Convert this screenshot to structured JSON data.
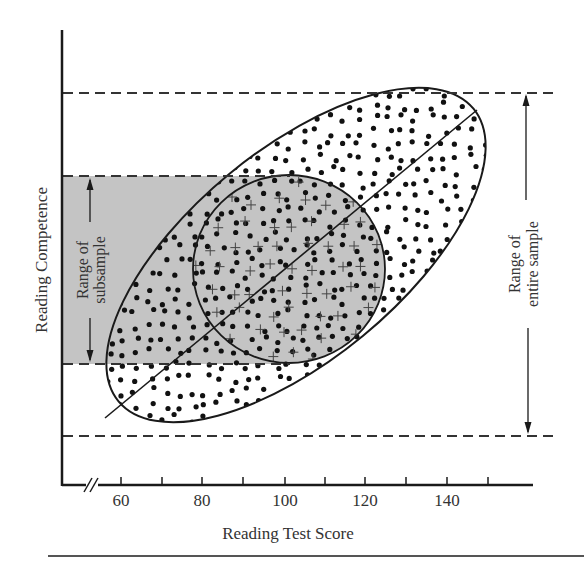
{
  "chart_data": {
    "type": "scatter",
    "title": "",
    "xlabel": "Reading Test Score",
    "ylabel": "Reading Competence",
    "x_ticks": [
      60,
      70,
      80,
      90,
      100,
      110,
      120,
      130,
      140,
      150
    ],
    "x_tick_labels": [
      "60",
      "80",
      "100",
      "120",
      "140"
    ],
    "x_axis_break": true,
    "xlim": [
      50,
      162
    ],
    "y_ticks": [],
    "grid": false,
    "legend": null,
    "annotations": [
      {
        "text": "Range of subsample",
        "type": "vertical-double-arrow",
        "position": "left, inside gray band"
      },
      {
        "text": "Range of entire sample",
        "type": "vertical-double-arrow",
        "position": "right, between dashed lines"
      }
    ],
    "series": [
      {
        "name": "entire sample",
        "marker": "dot",
        "shape": "elongated ellipse along regression line, x range ~57 to ~152"
      },
      {
        "name": "subsample",
        "marker": "plus",
        "shape": "circle centered near x=100, x range ~82 to ~120"
      }
    ],
    "regression_line": {
      "x_start": 57,
      "x_end": 147,
      "direction": "positive"
    },
    "shaded_band": {
      "label": "Range of subsample",
      "color": "#c4c4c4"
    }
  },
  "labels": {
    "x_axis_title": "Reading Test Score",
    "y_axis_title": "Reading Competence",
    "subsample_line1": "Range of",
    "subsample_line2": "subsample",
    "entire_line1": "Range of",
    "entire_line2": "entire sample",
    "tick_60": "60",
    "tick_80": "80",
    "tick_100": "100",
    "tick_120": "120",
    "tick_140": "140"
  },
  "colors": {
    "ink": "#1a1a1a",
    "band": "#c4c4c4",
    "text": "#333333"
  }
}
